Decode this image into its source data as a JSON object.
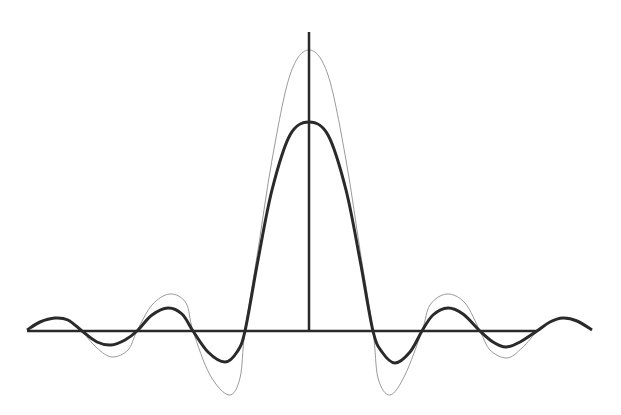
{
  "chart_data": {
    "type": "line",
    "title": "",
    "xlabel": "",
    "ylabel": "",
    "grid": false,
    "legend": null,
    "axes": {
      "x_axis": {
        "x1": 27,
        "x2": 537,
        "y": 331
      },
      "y_axis": {
        "x": 309,
        "y1": 32,
        "y2": 331
      }
    },
    "series": [
      {
        "name": "thin-curve",
        "color": "#9a9a9a",
        "stroke_width": 1,
        "points": [
          [
            82,
            331
          ],
          [
            97,
            348
          ],
          [
            112,
            357
          ],
          [
            128,
            350
          ],
          [
            137,
            331
          ],
          [
            152,
            305
          ],
          [
            170,
            294
          ],
          [
            186,
            303
          ],
          [
            193,
            331
          ],
          [
            210,
            375
          ],
          [
            229,
            395
          ],
          [
            240,
            378
          ],
          [
            245,
            331
          ],
          [
            258,
            250
          ],
          [
            272,
            160
          ],
          [
            290,
            75
          ],
          [
            309,
            50
          ],
          [
            328,
            75
          ],
          [
            346,
            160
          ],
          [
            360,
            250
          ],
          [
            373,
            331
          ],
          [
            378,
            378
          ],
          [
            390,
            395
          ],
          [
            405,
            375
          ],
          [
            422,
            331
          ],
          [
            430,
            305
          ],
          [
            447,
            294
          ],
          [
            465,
            303
          ],
          [
            480,
            331
          ],
          [
            490,
            350
          ],
          [
            507,
            358
          ],
          [
            522,
            348
          ],
          [
            537,
            331
          ]
        ]
      },
      {
        "name": "thick-curve",
        "color": "#2a2a2a",
        "stroke_width": 3,
        "points": [
          [
            27,
            330
          ],
          [
            40,
            322
          ],
          [
            55,
            318
          ],
          [
            68,
            320
          ],
          [
            82,
            331
          ],
          [
            97,
            342
          ],
          [
            111,
            345
          ],
          [
            125,
            340
          ],
          [
            137,
            331
          ],
          [
            152,
            315
          ],
          [
            168,
            308
          ],
          [
            182,
            314
          ],
          [
            193,
            331
          ],
          [
            208,
            352
          ],
          [
            225,
            362
          ],
          [
            237,
            352
          ],
          [
            245,
            331
          ],
          [
            258,
            260
          ],
          [
            272,
            190
          ],
          [
            290,
            135
          ],
          [
            309,
            122
          ],
          [
            328,
            135
          ],
          [
            346,
            190
          ],
          [
            360,
            260
          ],
          [
            373,
            331
          ],
          [
            382,
            352
          ],
          [
            395,
            363
          ],
          [
            410,
            352
          ],
          [
            422,
            331
          ],
          [
            433,
            315
          ],
          [
            448,
            308
          ],
          [
            463,
            314
          ],
          [
            480,
            331
          ],
          [
            493,
            342
          ],
          [
            506,
            347
          ],
          [
            520,
            342
          ],
          [
            537,
            331
          ],
          [
            550,
            322
          ],
          [
            563,
            318
          ],
          [
            577,
            321
          ],
          [
            592,
            330
          ]
        ]
      }
    ]
  }
}
